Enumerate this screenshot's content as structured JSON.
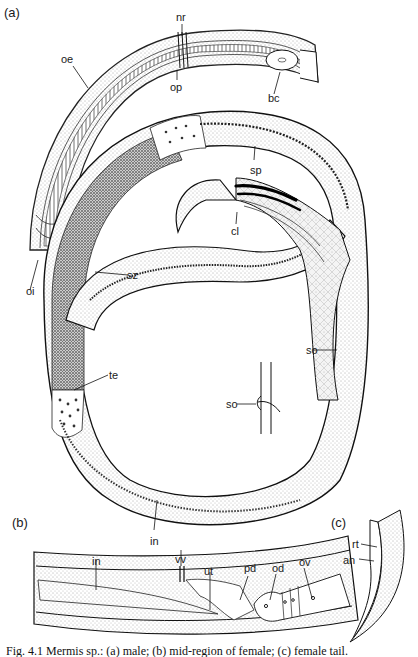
{
  "figure": {
    "panels": {
      "a": "(a)",
      "b": "(b)",
      "c": "(c)"
    },
    "labels_a": {
      "nr": "nr",
      "oe": "oe",
      "op": "op",
      "bc": "bc",
      "sp": "sp",
      "cl": "cl",
      "oi": "oi",
      "sz": "sz",
      "so1": "so",
      "so2": "so",
      "te": "te",
      "in": "in"
    },
    "labels_b": {
      "in": "in",
      "vv": "vv",
      "ut": "ut",
      "pd": "pd",
      "od": "od",
      "ov": "ov"
    },
    "labels_c": {
      "rt": "rt",
      "an": "an"
    },
    "caption": "Fig. 4.1   Mermis sp.: (a) male; (b) mid-region of female; (c) female tail."
  }
}
